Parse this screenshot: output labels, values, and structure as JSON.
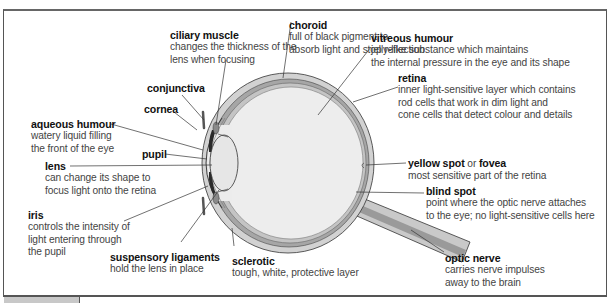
{
  "diagram": {
    "labels": [
      {
        "id": "ciliary_muscle",
        "title": "ciliary muscle",
        "desc": [
          "changes the thickness of the",
          "lens when focusing"
        ]
      },
      {
        "id": "choroid",
        "title": "choroid",
        "desc": [
          "full of black pigment to",
          "absorb light and stop reflection"
        ]
      },
      {
        "id": "conjunctiva",
        "title": "conjunctiva",
        "desc": []
      },
      {
        "id": "cornea",
        "title": "cornea",
        "desc": []
      },
      {
        "id": "aqueous_humour",
        "title": "aqueous humour",
        "desc": [
          "watery liquid filling",
          "the front of the eye"
        ]
      },
      {
        "id": "vitreous_humour",
        "title": "vitreous humour",
        "desc": [
          "jelly-like substance which maintains",
          "the internal pressure in the eye and its shape"
        ]
      },
      {
        "id": "retina",
        "title": "retina",
        "desc": [
          "inner light-sensitive layer which contains",
          "rod cells that work in dim light and",
          "cone cells that detect colour and details"
        ]
      },
      {
        "id": "pupil",
        "title": "pupil",
        "desc": []
      },
      {
        "id": "lens",
        "title": "lens",
        "desc": [
          "can change its shape to",
          "focus light onto the retina"
        ]
      },
      {
        "id": "yellow_spot",
        "title": "yellow spot",
        "or": "or",
        "title2": "fovea",
        "desc": [
          "most sensitive part of the retina"
        ]
      },
      {
        "id": "blind_spot",
        "title": "blind spot",
        "desc": [
          "point where the optic nerve attaches",
          "to the eye; no light-sensitive cells here"
        ]
      },
      {
        "id": "iris",
        "title": "iris",
        "desc": [
          "controls the intensity of",
          "light entering through",
          "the pupil"
        ]
      },
      {
        "id": "suspensory_ligaments",
        "title": "suspensory ligaments",
        "desc": [
          "hold the lens in place"
        ]
      },
      {
        "id": "sclerotic",
        "title": "sclerotic",
        "desc": [
          "tough, white, protective layer"
        ]
      },
      {
        "id": "optic_nerve",
        "title": "optic nerve",
        "desc": [
          "carries nerve impulses",
          "away to the brain"
        ]
      }
    ],
    "colors": {
      "sclera_fill": "#c9c9c9",
      "choroid_fill": "#a8a8a8",
      "inner_fill": "#ececec",
      "iris_fill": "#2a2a2a",
      "line": "#333333",
      "frame": "#555555"
    }
  }
}
